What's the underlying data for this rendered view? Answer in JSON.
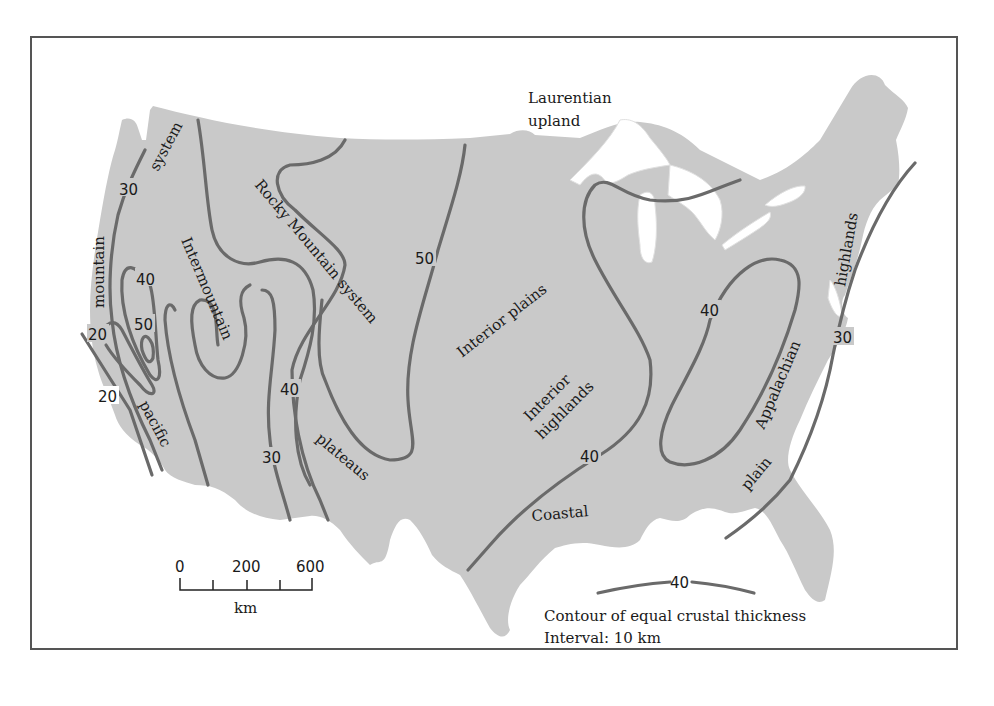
{
  "figure": {
    "colors": {
      "land": "#c9c9c9",
      "contour": "#6a6a6a",
      "frame": "#555555",
      "text": "#1a1a1a"
    }
  },
  "regions": {
    "laurentian_1": "Laurentian",
    "laurentian_2": "upland",
    "pacific_mountain_1": "mountain",
    "pacific_mountain_2": "system",
    "pacific_mountain_3": "pacific",
    "intermountain": "Intermountain",
    "rocky": "Rocky Mountain system",
    "plateaus": "plateaus",
    "interior_plains": "Interior plains",
    "interior_highlands_1": "Interior",
    "interior_highlands_2": "highlands",
    "coastal": "Coastal",
    "plain": "plain",
    "appalachian": "Appalachian",
    "highlands": "highlands"
  },
  "contour_labels": [
    {
      "id": "c30_nw",
      "value": "30"
    },
    {
      "id": "c40_w",
      "value": "40"
    },
    {
      "id": "c50_w",
      "value": "50"
    },
    {
      "id": "c20_a",
      "value": "20"
    },
    {
      "id": "c20_b",
      "value": "20"
    },
    {
      "id": "c40_c",
      "value": "40"
    },
    {
      "id": "c30_c",
      "value": "30"
    },
    {
      "id": "c50_c",
      "value": "50"
    },
    {
      "id": "c40_s",
      "value": "40"
    },
    {
      "id": "c40_e",
      "value": "40"
    },
    {
      "id": "c30_e",
      "value": "30"
    }
  ],
  "scale_bar": {
    "ticks": [
      "0",
      "200",
      "600"
    ],
    "unit": "km"
  },
  "legend": {
    "sample_value": "40",
    "line1": "Contour of equal crustal thickness",
    "line2": "Interval:  10 km"
  }
}
